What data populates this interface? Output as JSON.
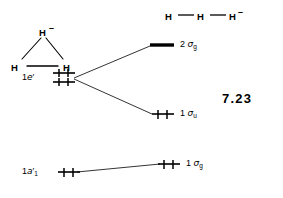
{
  "figure": {
    "number": "7.23",
    "type": "molecular-orbital-correlation-diagram"
  },
  "structures": {
    "triangular": {
      "name": "triangular-h3-minus",
      "atoms": [
        {
          "label": "H",
          "x": 42,
          "y": 33
        },
        {
          "label": "H",
          "x": 14,
          "y": 68
        },
        {
          "label": "H",
          "x": 66,
          "y": 68
        }
      ],
      "charge": "–"
    },
    "linear": {
      "name": "linear-h3-minus",
      "atoms": [
        {
          "label": "H",
          "x": 168,
          "y": 16
        },
        {
          "label": "H",
          "x": 200,
          "y": 16
        },
        {
          "label": "H",
          "x": 232,
          "y": 16
        }
      ],
      "charge": "–"
    }
  },
  "levels": {
    "left": [
      {
        "id": "1e-prime",
        "label_base": "1",
        "label_sym": "e",
        "label_prime": "′",
        "label_sub": "",
        "electrons": 4,
        "degenerate": true
      },
      {
        "id": "1a1-prime",
        "label_base": "1",
        "label_sym": "a",
        "label_prime": "′",
        "label_sub": "1",
        "electrons": 2,
        "degenerate": false
      }
    ],
    "right": [
      {
        "id": "2sigma-g",
        "label_base": "2",
        "label_sym": "σ",
        "label_prime": "",
        "label_sub": "g",
        "electrons": 0,
        "degenerate": false
      },
      {
        "id": "1sigma-u",
        "label_base": "1",
        "label_sym": "σ",
        "label_prime": "",
        "label_sub": "u",
        "electrons": 2,
        "degenerate": false
      },
      {
        "id": "1sigma-g",
        "label_base": "1",
        "label_sym": "σ",
        "label_prime": "",
        "label_sub": "g",
        "electrons": 2,
        "degenerate": false
      }
    ]
  },
  "colors": {
    "ink": "#000000",
    "background": "#ffffff"
  }
}
